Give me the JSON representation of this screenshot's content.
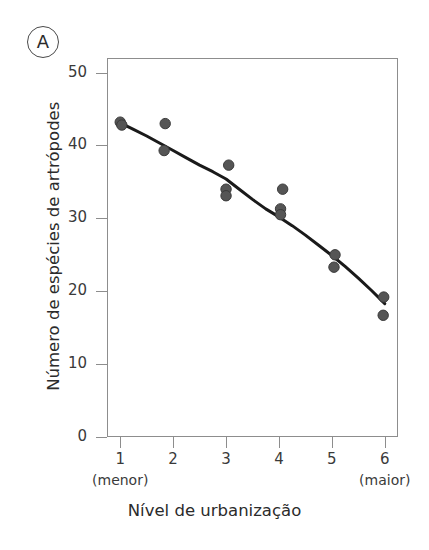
{
  "panel": {
    "label": "A"
  },
  "chart_data": {
    "type": "scatter",
    "title": "",
    "subtitle": "",
    "xlabel": "Nível de urbanização",
    "ylabel": "Número de espécies de artrópodes",
    "xlim": [
      0.75,
      6.25
    ],
    "ylim": [
      0,
      52
    ],
    "grid": false,
    "legend": null,
    "x_ticks": [
      1,
      2,
      3,
      4,
      5,
      6
    ],
    "x_tick_labels": [
      "1",
      "2",
      "3",
      "4",
      "5",
      "6"
    ],
    "x_tick_sublabels": [
      "(menor)",
      "",
      "",
      "",
      "",
      "(maior)"
    ],
    "y_ticks": [
      0,
      10,
      20,
      30,
      40,
      50
    ],
    "y_tick_labels": [
      "0",
      "10",
      "20",
      "30",
      "40",
      "50"
    ],
    "marker_color": "#555555",
    "marker_edge_color": "#3a3a3a",
    "line_color": "#1a1a1a",
    "axis_color": "#8d8d8d",
    "points": [
      {
        "x": 1.0,
        "y": 43.2
      },
      {
        "x": 1.03,
        "y": 42.8
      },
      {
        "x": 1.85,
        "y": 43.0
      },
      {
        "x": 1.83,
        "y": 39.3
      },
      {
        "x": 3.05,
        "y": 37.3
      },
      {
        "x": 3.0,
        "y": 34.0
      },
      {
        "x": 3.0,
        "y": 33.1
      },
      {
        "x": 4.07,
        "y": 34.0
      },
      {
        "x": 4.03,
        "y": 31.3
      },
      {
        "x": 4.03,
        "y": 30.5
      },
      {
        "x": 5.06,
        "y": 25.0
      },
      {
        "x": 5.04,
        "y": 23.3
      },
      {
        "x": 5.98,
        "y": 19.2
      },
      {
        "x": 5.97,
        "y": 16.7
      }
    ],
    "fit_line": {
      "name": "curva ajustada",
      "x": [
        1.0,
        1.25,
        1.5,
        1.75,
        2.0,
        2.25,
        2.5,
        2.75,
        3.0,
        3.25,
        3.5,
        3.75,
        4.0,
        4.25,
        4.5,
        4.75,
        5.0,
        5.25,
        5.5,
        5.75,
        6.0
      ],
      "y": [
        43.1,
        42.2,
        41.3,
        40.3,
        39.3,
        38.3,
        37.3,
        36.4,
        35.4,
        34.0,
        32.6,
        31.3,
        30.2,
        29.0,
        27.7,
        26.3,
        24.9,
        23.4,
        21.8,
        20.1,
        18.3
      ]
    }
  }
}
